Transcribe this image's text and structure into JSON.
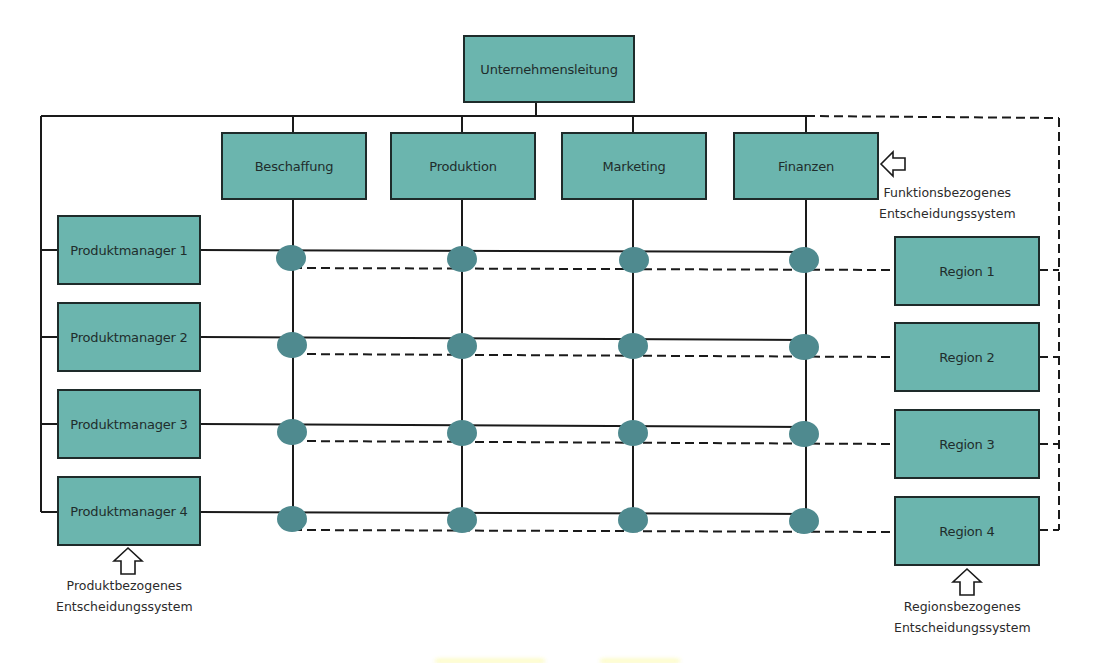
{
  "diagram": {
    "colors": {
      "box_fill": "#6bb5ae",
      "box_border": "#1e2b2a",
      "node_fill": "#4f8a8f",
      "line": "#1a1a1a"
    },
    "top": {
      "label": "Unternehmensleitung"
    },
    "functions": [
      {
        "label": "Beschaffung"
      },
      {
        "label": "Produktion"
      },
      {
        "label": "Marketing"
      },
      {
        "label": "Finanzen"
      }
    ],
    "products": [
      {
        "label": "Produktmanager 1"
      },
      {
        "label": "Produktmanager 2"
      },
      {
        "label": "Produktmanager 3"
      },
      {
        "label": "Produktmanager 4"
      }
    ],
    "regions": [
      {
        "label": "Region 1"
      },
      {
        "label": "Region 2"
      },
      {
        "label": "Region 3"
      },
      {
        "label": "Region 4"
      }
    ],
    "annotations": {
      "function_system": {
        "line1": "Funktionsbezogenes",
        "line2": "Entscheidungssystem"
      },
      "product_system": {
        "line1": "Produktbezogenes",
        "line2": "Entscheidungssystem"
      },
      "region_system": {
        "line1": "Regionsbezogenes",
        "line2": "Entscheidungssystem"
      }
    },
    "legend_line_types": {
      "solid": "Produkt-/Funktionsbeziehung",
      "dashed": "Regionsbeziehung"
    }
  }
}
